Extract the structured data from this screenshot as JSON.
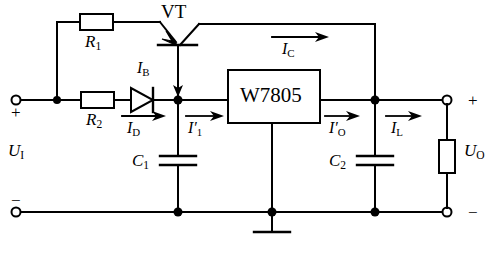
{
  "figure": {
    "type": "electronic-circuit-schematic",
    "background_color": "#ffffff",
    "line_color": "#000000"
  },
  "components": {
    "resistor_r1": {
      "label": "R",
      "subscript": "1",
      "orientation": "horizontal"
    },
    "resistor_r2": {
      "label": "R",
      "subscript": "2",
      "orientation": "horizontal"
    },
    "transistor": {
      "label": "VT",
      "type": "PNP-pass-transistor"
    },
    "diode": {
      "name": "diode",
      "orientation": "anode-left"
    },
    "regulator": {
      "label": "W7805",
      "type": "three-terminal-voltage-regulator"
    },
    "capacitor_c1": {
      "label": "C",
      "subscript": "1",
      "orientation": "vertical"
    },
    "capacitor_c2": {
      "label": "C",
      "subscript": "2",
      "orientation": "vertical"
    },
    "load_resistor": {
      "name": "load",
      "orientation": "vertical"
    },
    "ground": {
      "name": "ground-symbol"
    }
  },
  "labels": {
    "vt": "VT",
    "regulator": "W7805",
    "r1": {
      "base": "R",
      "sub": "1"
    },
    "r2": {
      "base": "R",
      "sub": "2"
    },
    "c1": {
      "base": "C",
      "sub": "1"
    },
    "c2": {
      "base": "C",
      "sub": "2"
    },
    "ui": {
      "base": "U",
      "sub": "I"
    },
    "uo": {
      "base": "U",
      "sub": "O"
    },
    "ib": {
      "base": "I",
      "sub": "B"
    },
    "ic": {
      "base": "I",
      "sub": "C"
    },
    "id": {
      "base": "I",
      "sub": "D"
    },
    "i1p": {
      "base": "I",
      "prime": "′",
      "sub": "1"
    },
    "iop": {
      "base": "I",
      "prime": "′",
      "sub": "O"
    },
    "il": {
      "base": "I",
      "sub": "L"
    },
    "plus_in": "+",
    "minus_in": "−",
    "plus_out": "+",
    "minus_out": "−"
  },
  "currents": [
    {
      "name": "I_B",
      "direction": "down",
      "at": "transistor-emitter-to-node"
    },
    {
      "name": "I_C",
      "direction": "right",
      "at": "top-collector-branch"
    },
    {
      "name": "I_D",
      "direction": "right",
      "at": "diode-branch"
    },
    {
      "name": "I'_1",
      "direction": "right",
      "at": "regulator-input"
    },
    {
      "name": "I'_O",
      "direction": "right",
      "at": "regulator-output"
    },
    {
      "name": "I_L",
      "direction": "right",
      "at": "load-branch"
    }
  ],
  "terminals": {
    "input_positive": "+",
    "input_negative": "−",
    "output_positive": "+",
    "output_negative": "−"
  }
}
